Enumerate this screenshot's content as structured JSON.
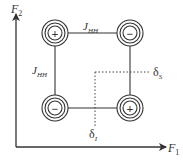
{
  "diagram": {
    "axes": {
      "x_label": "F",
      "x_sub": "1",
      "y_label": "F",
      "y_sub": "2"
    },
    "couplings": {
      "top": {
        "label": "J",
        "sub": "HH"
      },
      "left": {
        "label": "J",
        "sub": "HH"
      }
    },
    "peaks": [
      {
        "position": "top-left",
        "sign": "+"
      },
      {
        "position": "top-right",
        "sign": "−"
      },
      {
        "position": "bottom-left",
        "sign": "−"
      },
      {
        "position": "bottom-right",
        "sign": "+"
      }
    ],
    "shifts": {
      "s": {
        "label": "δ",
        "sub": "S"
      },
      "i": {
        "label": "δ",
        "sub": "I"
      }
    },
    "colors": {
      "ink": "#333333",
      "background": "#ffffff"
    }
  }
}
